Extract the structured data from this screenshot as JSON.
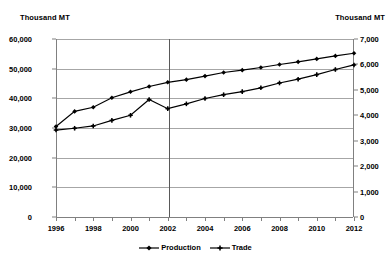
{
  "axes": {
    "left_unit": "Thousand MT",
    "right_unit": "Thousand MT",
    "left_ticks": [
      "0",
      "10,000",
      "20,000",
      "30,000",
      "40,000",
      "50,000",
      "60,000"
    ],
    "right_ticks": [
      "0",
      "1,000",
      "2,000",
      "3,000",
      "4,000",
      "5,000",
      "6,000",
      "7,000"
    ],
    "x_ticks": [
      "1996",
      "1998",
      "2000",
      "2002",
      "2004",
      "2006",
      "2008",
      "2010",
      "2012"
    ]
  },
  "legend": {
    "items": [
      {
        "label": "Production",
        "marker": "diamond-marker",
        "color": "#000000"
      },
      {
        "label": "Trade",
        "marker": "plus-marker",
        "color": "#000000"
      }
    ]
  },
  "colors": {
    "series": "#000000",
    "gridline": "#a6a6a6",
    "axis": "#808080",
    "divider": "#595959",
    "background": "#ffffff"
  },
  "chart_data": {
    "type": "line",
    "title": "",
    "xlabel": "",
    "ylabel": "Thousand MT",
    "y2label": "Thousand MT",
    "ylim": [
      0,
      60000
    ],
    "y2lim": [
      0,
      7000
    ],
    "grid": true,
    "legend_position": "bottom",
    "annotations": [
      {
        "type": "vertical-line",
        "x": 2002,
        "note": "estimate/forecast divider"
      }
    ],
    "x": [
      1996,
      1997,
      1998,
      1999,
      2000,
      2001,
      2002,
      2003,
      2004,
      2005,
      2006,
      2007,
      2008,
      2009,
      2010,
      2011,
      2012
    ],
    "series": [
      {
        "name": "Production",
        "axis": "left",
        "unit": "Thousand MT",
        "values": [
          30500,
          35600,
          37000,
          40200,
          42200,
          44000,
          45400,
          46300,
          47500,
          48700,
          49500,
          50400,
          51400,
          52300,
          53300,
          54300,
          55200
        ]
      },
      {
        "name": "Trade",
        "axis": "right",
        "unit": "Thousand MT",
        "values": [
          3420,
          3490,
          3580,
          3800,
          4000,
          4620,
          4260,
          4450,
          4660,
          4810,
          4930,
          5080,
          5270,
          5420,
          5600,
          5800,
          5980
        ]
      }
    ]
  }
}
